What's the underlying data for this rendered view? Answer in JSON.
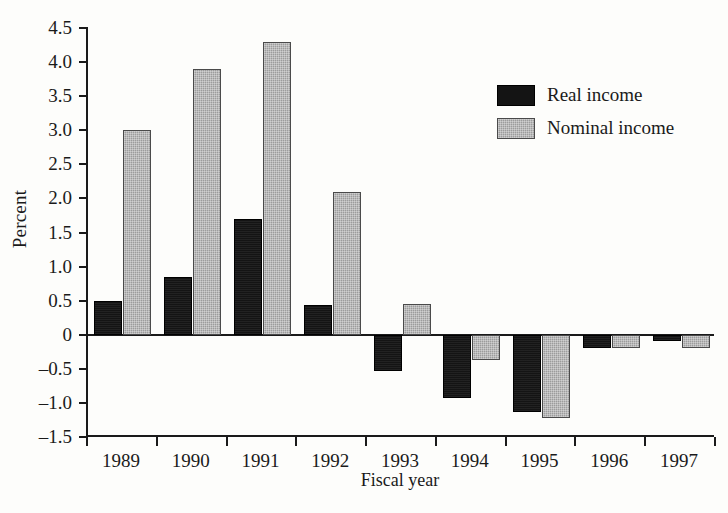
{
  "chart_data": {
    "type": "bar",
    "title": "",
    "xlabel": "Fiscal year",
    "ylabel": "Percent",
    "categories": [
      "1989",
      "1990",
      "1991",
      "1992",
      "1993",
      "1994",
      "1995",
      "1996",
      "1997"
    ],
    "series": [
      {
        "name": "Real income",
        "color": "#141414",
        "values": [
          0.5,
          0.85,
          1.7,
          0.44,
          -0.53,
          -0.93,
          -1.13,
          -0.2,
          -0.09
        ]
      },
      {
        "name": "Nominal income",
        "color": "#9c9c9c",
        "values": [
          3.0,
          3.9,
          4.3,
          2.1,
          0.45,
          -0.37,
          -1.22,
          -0.2,
          -0.19
        ]
      }
    ],
    "ylim": [
      -1.5,
      4.5
    ],
    "yticks": [
      "4.5",
      "4.0",
      "3.5",
      "3.0",
      "2.5",
      "2.0",
      "1.5",
      "1.0",
      "0.5",
      "0",
      "–0.5",
      "–1.0",
      "–1.5"
    ],
    "ytick_values": [
      4.5,
      4.0,
      3.5,
      3.0,
      2.5,
      2.0,
      1.5,
      1.0,
      0.5,
      0,
      -0.5,
      -1.0,
      -1.5
    ],
    "grid": false,
    "legend_position": "upper-right"
  },
  "legend": {
    "items": [
      {
        "label": "Real income",
        "swatch": "black-swatch"
      },
      {
        "label": "Nominal income",
        "swatch": "gray-swatch"
      }
    ]
  }
}
